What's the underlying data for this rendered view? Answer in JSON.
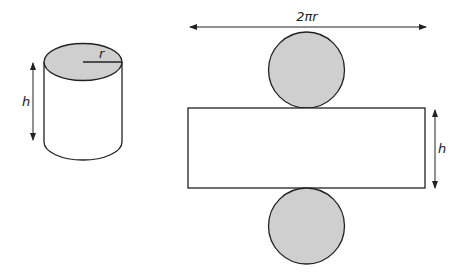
{
  "colors": {
    "stroke": "#222222",
    "fill_circle": "#cfcfcf",
    "background": "#ffffff"
  },
  "cylinder": {
    "radius_label": "r",
    "height_label": "h"
  },
  "net": {
    "width_label": "2πr",
    "height_label": "h",
    "parts": [
      "top circle",
      "rectangle",
      "bottom circle"
    ]
  }
}
